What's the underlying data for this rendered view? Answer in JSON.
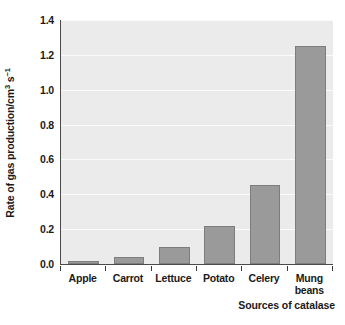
{
  "chart_data": {
    "type": "bar",
    "title": "",
    "subtitle": "",
    "categories": [
      "Apple",
      "Carrot",
      "Lettuce",
      "Potato",
      "Celery",
      "Mung\nbeans"
    ],
    "values": [
      0.02,
      0.04,
      0.1,
      0.22,
      0.455,
      1.25
    ],
    "xlabel": "Sources of catalase",
    "ylabel": "Rate of gas production/cm",
    "ylabel_sup1": "3",
    "ylabel_mid": " s",
    "ylabel_sup2": "−1",
    "ylabel_full": "Rate of gas production/cm3 s-1",
    "ylim": [
      0.0,
      1.4
    ],
    "yticks": [
      "0.0",
      "0.2",
      "0.4",
      "0.6",
      "0.8",
      "1.0",
      "1.2",
      "1.4"
    ],
    "ytick_values": [
      0.0,
      0.2,
      0.4,
      0.6,
      0.8,
      1.0,
      1.2,
      1.4
    ],
    "grid": true,
    "grid_axis": "y",
    "legend": false,
    "legend_position": "none",
    "series": [
      {
        "name": "Rate of gas production",
        "values": [
          0.02,
          0.04,
          0.1,
          0.22,
          0.455,
          1.25
        ]
      }
    ],
    "annotations": []
  },
  "style": {
    "bar_fill": "#9a9a9a",
    "bar_border": "#7d7d7d",
    "plot_background": "#ebebeb",
    "gridline_color": "#fbfbfb",
    "axis_color": "#4a4a4a",
    "text_color": "#1a1a1a",
    "page_background": "#ffffff"
  }
}
